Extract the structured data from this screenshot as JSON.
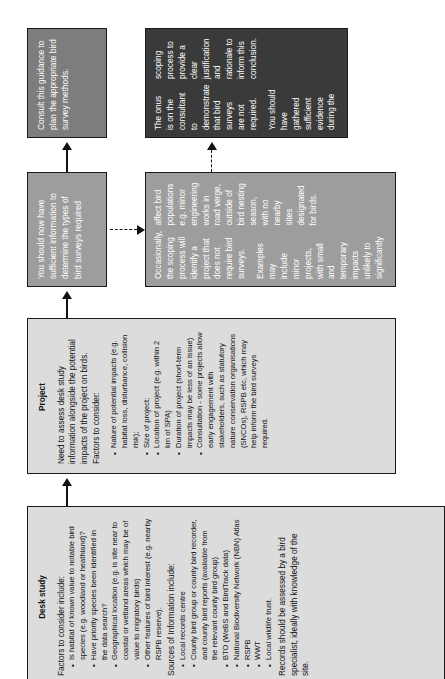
{
  "diagram": {
    "orientation": "rotated-90-ccw",
    "colors": {
      "dark_box": "#3a3a3a",
      "mid_box": "#7d7d7d",
      "light_box": "#9d9d9d",
      "pale_box": "#dcdcdc",
      "outline": "#1a1a1a",
      "connector": "#111111"
    }
  },
  "nodes": {
    "desk_study": {
      "title": "Desk study",
      "intro": "Factors to consider include:",
      "factors": [
        "Is habitat of known value to notable bird species (e.g. woodland or heathland)?",
        "Have priority species been identified in the data search?",
        "Geographical location (e.g. is site near to coastal or wetland areas which may be of value to migratory birds)",
        "Other features of bird interest (e.g. nearby RSPB reserve)."
      ],
      "sources_intro": "Sources of Information include:",
      "sources": [
        "Local records centre",
        "County bird group or county bird recorder, and county bird reports (available from the relevant county bird group)",
        "BTO (WeBS and BirdTrack data)",
        "National Biodiversity Network (NBN) Atlas",
        "RSPB",
        "WWT",
        "Local wildlife trust."
      ],
      "closing": "Records should be assessed by a bird specialist, ideally with knowledge of the site."
    },
    "project": {
      "title": "Project",
      "intro": "Need to assess desk study information alongside the potential impacts of the project on birds. Factors to consider:",
      "factors": [
        "Nature of potential impacts (e.g. habitat loss, disturbance, collision risk);",
        "Size of project;",
        "Location of project (e.g. within 2 km of SPA)",
        "Duration of project (short-term impacts may be less of an issue)",
        "Consultation - some projects allow early engagement with stakeholders, such as statutory nature conservation organisations (SNCOs), RSPB etc, which may help inform the bird surveys required."
      ]
    },
    "sufficient_info": {
      "text": "You should now have sufficient information to determine the types of bird surveys required"
    },
    "no_survey_needed": {
      "paragraphs": [
        "Occasionally, the scoping process will identify a project that does not require bird surveys.",
        "Examples may include minor projects, with small and temporary impacts unlikely to significantly affect bird populations e.g. minor engineering works in road verge, outside of bird nesting season, with no nearby sites designated for birds."
      ]
    },
    "consult_guidance": {
      "text": "Consult this guidance to plan the appropriate bird survey methods."
    },
    "onus": {
      "paragraphs": [
        "The onus is on the consultant to demonstrate that bird surveys are not required.",
        "You should have gathered sufficient evidence during the scoping process to provide a clear justification and rationale to inform this conclusion."
      ]
    }
  },
  "connectors": [
    {
      "name": "desk-study-to-project",
      "style": "solid",
      "direction": "up"
    },
    {
      "name": "project-to-sufficient-info",
      "style": "solid",
      "direction": "up"
    },
    {
      "name": "sufficient-info-to-consult-guidance",
      "style": "solid",
      "direction": "up"
    },
    {
      "name": "sufficient-info-to-no-survey-needed",
      "style": "dashed",
      "direction": "right"
    },
    {
      "name": "no-survey-needed-to-onus",
      "style": "dashed",
      "direction": "up"
    }
  ]
}
